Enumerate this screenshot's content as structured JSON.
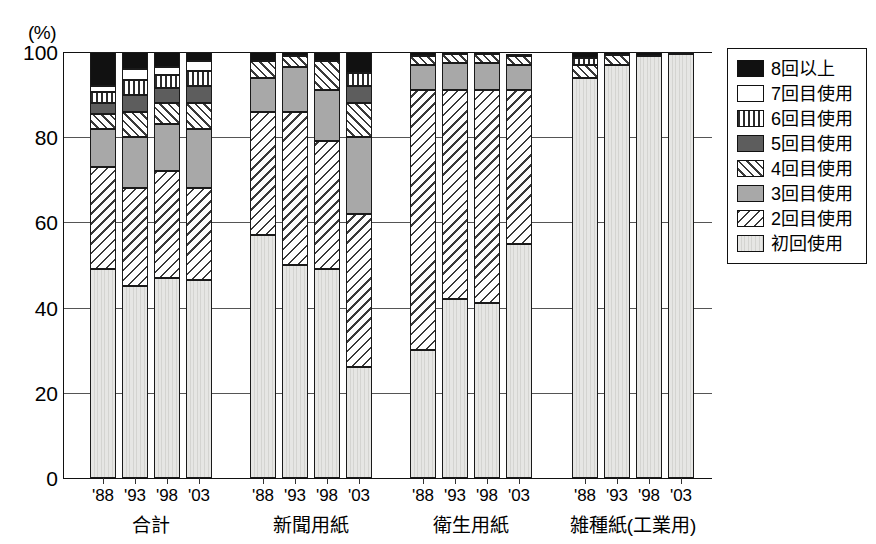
{
  "axis": {
    "unit": "(%)",
    "y_ticks": [
      "100",
      "80",
      "60",
      "40",
      "20",
      "0"
    ]
  },
  "groups": [
    {
      "name": "合計",
      "years": [
        "'88",
        "'93",
        "'98",
        "'03"
      ]
    },
    {
      "name": "新聞用紙",
      "years": [
        "'88",
        "'93",
        "'98",
        "'03"
      ]
    },
    {
      "name": "衛生用紙",
      "years": [
        "'88",
        "'93",
        "'98",
        "'03"
      ]
    },
    {
      "name": "雑種紙(工業用)",
      "years": [
        "'88",
        "'93",
        "'98",
        "'03"
      ]
    }
  ],
  "legend": {
    "items": [
      {
        "label": "8回以上",
        "pattern": "solid-black",
        "swatch_class": "p-black"
      },
      {
        "label": "7回目使用",
        "pattern": "solid-white",
        "swatch_class": "p-white"
      },
      {
        "label": "6回目使用",
        "pattern": "vertical-stripes",
        "swatch_class": "p-vert"
      },
      {
        "label": "5回目使用",
        "pattern": "solid-dark-gray",
        "swatch_class": "p-darkgray"
      },
      {
        "label": "4回目使用",
        "pattern": "diagonal-hatch-up",
        "swatch_class": "p-diagR"
      },
      {
        "label": "3回目使用",
        "pattern": "solid-gray",
        "swatch_class": "p-gray"
      },
      {
        "label": "2回目使用",
        "pattern": "diagonal-hatch-down",
        "swatch_class": "p-diagL"
      },
      {
        "label": "初回使用",
        "pattern": "light-vertical",
        "swatch_class": "p-light"
      }
    ]
  },
  "chart_data": {
    "type": "bar",
    "subtype": "stacked-bar-100percent",
    "title": "",
    "xlabel": "",
    "ylabel": "(%)",
    "ylim": [
      0,
      100
    ],
    "grid": true,
    "legend_position": "right",
    "categories": [
      "合計 '88",
      "合計 '93",
      "合計 '98",
      "合計 '03",
      "新聞用紙 '88",
      "新聞用紙 '93",
      "新聞用紙 '98",
      "新聞用紙 '03",
      "衛生用紙 '88",
      "衛生用紙 '93",
      "衛生用紙 '98",
      "衛生用紙 '03",
      "雑種紙(工業用) '88",
      "雑種紙(工業用) '93",
      "雑種紙(工業用) '98",
      "雑種紙(工業用) '03"
    ],
    "series": [
      {
        "name": "初回使用",
        "pattern": "light-vertical",
        "values": [
          49.0,
          45.0,
          47.0,
          46.5,
          57.0,
          50.0,
          49.0,
          26.0,
          30.0,
          42.0,
          41.0,
          55.0,
          94.0,
          97.0,
          99.0,
          99.5
        ]
      },
      {
        "name": "2回目使用",
        "pattern": "diagonal-hatch-down",
        "values": [
          24.0,
          23.0,
          25.0,
          21.5,
          29.0,
          36.0,
          30.0,
          36.0,
          61.0,
          49.0,
          50.0,
          36.0,
          0.0,
          0.0,
          0.0,
          0.0
        ]
      },
      {
        "name": "3回目使用",
        "pattern": "solid-gray",
        "values": [
          9.0,
          12.0,
          11.0,
          14.0,
          8.0,
          10.5,
          12.0,
          18.0,
          6.0,
          6.5,
          6.5,
          6.0,
          0.0,
          0.0,
          0.0,
          0.0
        ]
      },
      {
        "name": "4回目使用",
        "pattern": "diagonal-hatch-up",
        "values": [
          3.5,
          6.0,
          5.0,
          6.0,
          4.0,
          2.5,
          7.0,
          8.0,
          2.0,
          2.0,
          2.0,
          2.0,
          3.0,
          2.2,
          0.0,
          0.0
        ]
      },
      {
        "name": "5回目使用",
        "pattern": "solid-dark-gray",
        "values": [
          2.5,
          4.0,
          3.5,
          4.0,
          0.0,
          0.0,
          0.0,
          4.0,
          0.0,
          0.0,
          0.0,
          0.0,
          0.0,
          0.0,
          0.0,
          0.0
        ]
      },
      {
        "name": "6回目使用",
        "pattern": "vertical-stripes",
        "values": [
          2.5,
          3.5,
          3.0,
          3.5,
          0.0,
          0.0,
          0.0,
          3.0,
          0.0,
          0.0,
          0.0,
          0.0,
          1.5,
          0.0,
          0.0,
          0.0
        ]
      },
      {
        "name": "7回目使用",
        "pattern": "solid-white",
        "values": [
          1.5,
          2.5,
          2.0,
          2.5,
          0.0,
          0.0,
          0.0,
          0.0,
          0.0,
          0.0,
          0.0,
          0.0,
          0.0,
          0.0,
          0.0,
          0.0
        ]
      },
      {
        "name": "8回以上",
        "pattern": "solid-black",
        "values": [
          8.0,
          4.0,
          3.5,
          2.0,
          2.0,
          1.0,
          2.0,
          5.0,
          1.0,
          0.5,
          0.5,
          0.5,
          1.5,
          0.8,
          1.0,
          0.5
        ]
      }
    ]
  }
}
